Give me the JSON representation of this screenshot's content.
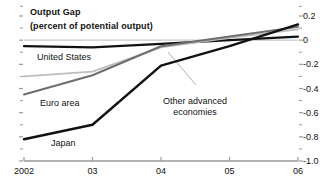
{
  "chart_data": {
    "type": "line",
    "title": "Output Gap",
    "subtitle": "(percent of potential output)",
    "xlabel": "",
    "ylabel": "",
    "x": [
      2002,
      2003,
      2004,
      2005,
      2006
    ],
    "xtick_labels": [
      "2002",
      "03",
      "04",
      "05",
      "06"
    ],
    "ytick_labels": [
      "0.2",
      "0",
      "-0.2",
      "-0.4",
      "-0.6",
      "-0.8",
      "-1.0"
    ],
    "ytick_values": [
      0.2,
      0,
      -0.2,
      -0.4,
      -0.6,
      -0.8,
      -1.0
    ],
    "ylim": [
      -1.0,
      0.2
    ],
    "xlim": [
      2002,
      2006
    ],
    "minor_ticks": true,
    "grid": false,
    "zero_line": true,
    "legend_position": "inline-annotations",
    "series": [
      {
        "name": "United States",
        "color": "#111111",
        "width": 2.2,
        "values": [
          -0.05,
          -0.06,
          -0.03,
          0.0,
          0.03
        ]
      },
      {
        "name": "Other advanced economies",
        "color": "#bdbdbd",
        "width": 1.8,
        "values": [
          -0.3,
          -0.26,
          -0.06,
          0.02,
          0.09
        ]
      },
      {
        "name": "Euro area",
        "color": "#6e6e6e",
        "width": 2.0,
        "values": [
          -0.45,
          -0.29,
          -0.05,
          0.03,
          0.11
        ]
      },
      {
        "name": "Japan",
        "color": "#111111",
        "width": 2.4,
        "values": [
          -0.82,
          -0.7,
          -0.21,
          -0.05,
          0.13
        ]
      }
    ],
    "annotations": [
      {
        "text": "United States",
        "x_px": 37,
        "y_px": 52
      },
      {
        "text": "Euro area",
        "x_px": 40,
        "y_px": 98
      },
      {
        "text": "Japan",
        "x_px": 51,
        "y_px": 138
      },
      {
        "text_line1": "Other advanced",
        "text_line2": "economies",
        "x_px": 163,
        "y_px": 96
      }
    ],
    "axis_color": "#9a9a9a",
    "text_color": "#111111"
  }
}
